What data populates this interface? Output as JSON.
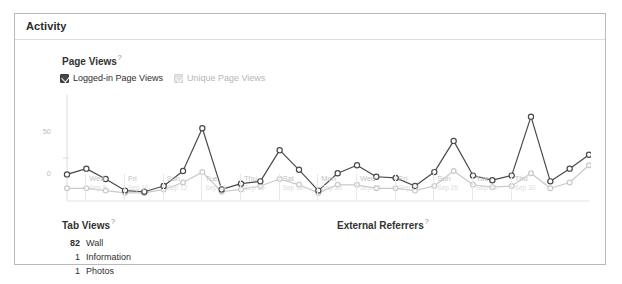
{
  "panel": {
    "title": "Activity"
  },
  "page_views": {
    "title": "Page Views",
    "help_marker": "?",
    "legend": [
      {
        "label": "Logged-in Page Views",
        "checked": true,
        "color": "#4a4a4a",
        "icon": "checkbox-checked-icon"
      },
      {
        "label": "Unique Page Views",
        "checked": true,
        "color": "#c9c9c9",
        "icon": "checkbox-checked-icon"
      }
    ]
  },
  "tab_views": {
    "title": "Tab Views",
    "help_marker": "?",
    "rows": [
      {
        "count": "82",
        "label": "Wall"
      },
      {
        "count": "1",
        "label": "Information"
      },
      {
        "count": "1",
        "label": "Photos"
      }
    ]
  },
  "external_referrers": {
    "title": "External Referrers",
    "help_marker": "?",
    "rows": []
  },
  "chart_data": {
    "type": "line",
    "title": "Page Views",
    "xlabel": "",
    "ylabel": "",
    "ylim": [
      0,
      90
    ],
    "yticks": [
      0,
      50
    ],
    "ytick_labels": [
      "0",
      "50"
    ],
    "grid": false,
    "legend_position": "top-left",
    "x": [
      "Sep 7",
      "Sep 8",
      "Sep 9",
      "Sep 10",
      "Sep 11",
      "Sep 12",
      "Sep 13",
      "Sep 14",
      "Sep 15",
      "Sep 16",
      "Sep 17",
      "Sep 18",
      "Sep 19",
      "Sep 20",
      "Sep 21",
      "Sep 22",
      "Sep 23",
      "Sep 24",
      "Sep 25",
      "Sep 26",
      "Sep 27",
      "Sep 28",
      "Sep 29",
      "Sep 30",
      "Oct 1",
      "Oct 2",
      "Oct 3",
      "Oct 4"
    ],
    "xtick_labels": [
      {
        "dow": "Wed",
        "date": "Sep 8"
      },
      {
        "dow": "Fri",
        "date": "Sep 10"
      },
      {
        "dow": "Sun",
        "date": "Sep 12"
      },
      {
        "dow": "Tue",
        "date": "Sep 14"
      },
      {
        "dow": "Thu",
        "date": "Sep 16"
      },
      {
        "dow": "Sat",
        "date": "Sep 18"
      },
      {
        "dow": "Mon",
        "date": "Sep 20"
      },
      {
        "dow": "Wed",
        "date": "Sep 22"
      },
      {
        "dow": "Fri",
        "date": "Sep 24"
      },
      {
        "dow": "Sun",
        "date": "Sep 26"
      },
      {
        "dow": "Tue",
        "date": "Sep 28"
      },
      {
        "dow": "Thu",
        "date": "Sep 30"
      }
    ],
    "series": [
      {
        "name": "Logged-in Page Views",
        "color": "#4a4a4a",
        "values": [
          23,
          28,
          19,
          9,
          8,
          13,
          26,
          63,
          10,
          15,
          17,
          44,
          27,
          9,
          24,
          31,
          21,
          20,
          13,
          25,
          52,
          22,
          18,
          22,
          73,
          17,
          28,
          40
        ]
      },
      {
        "name": "Unique Page Views",
        "color": "#c9c9c9",
        "values": [
          11,
          11,
          9,
          7,
          7,
          10,
          16,
          25,
          8,
          10,
          13,
          19,
          14,
          7,
          14,
          14,
          11,
          11,
          9,
          13,
          26,
          14,
          12,
          13,
          24,
          11,
          16,
          31
        ]
      }
    ]
  }
}
